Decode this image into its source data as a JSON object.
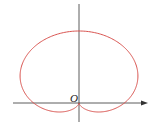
{
  "diagram": {
    "type": "polar-curve",
    "curve": "cardioid r = a(1 + sin θ)",
    "origin_label": "O",
    "colors": {
      "curve": "#d9534f",
      "axes": "#333333"
    }
  }
}
